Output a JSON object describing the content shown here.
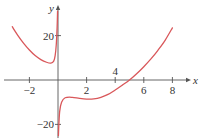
{
  "chart_data": {
    "type": "line",
    "title": "",
    "xlabel": "x",
    "ylabel": "y",
    "xlim": [
      -3.8,
      9.5
    ],
    "ylim": [
      -27,
      35
    ],
    "x_ticks": [
      {
        "value": -2,
        "label": "−2",
        "pos": "below"
      },
      {
        "value": 2,
        "label": "2",
        "pos": "below"
      },
      {
        "value": 4,
        "label": "4",
        "pos": "above"
      },
      {
        "value": 6,
        "label": "6",
        "pos": "below"
      },
      {
        "value": 8,
        "label": "8",
        "pos": "below"
      }
    ],
    "y_ticks": [
      {
        "value": 20,
        "label": "20"
      },
      {
        "value": -20,
        "label": "−20"
      }
    ],
    "grid": false,
    "curve_color": "#d9575a",
    "axis_color": "#555555",
    "series": [
      {
        "name": "left-branch",
        "points": [
          [
            -3.2,
            24
          ],
          [
            -2.8,
            20
          ],
          [
            -2.4,
            16.5
          ],
          [
            -2.0,
            13.5
          ],
          [
            -1.6,
            11
          ],
          [
            -1.2,
            9.2
          ],
          [
            -0.8,
            8
          ],
          [
            -0.5,
            7.6
          ],
          [
            -0.3,
            8.5
          ],
          [
            -0.2,
            11
          ],
          [
            -0.12,
            16
          ],
          [
            -0.06,
            24
          ],
          [
            -0.03,
            31
          ]
        ]
      },
      {
        "name": "right-branch",
        "points": [
          [
            0.03,
            -25
          ],
          [
            0.06,
            -20
          ],
          [
            0.12,
            -14
          ],
          [
            0.25,
            -10
          ],
          [
            0.5,
            -8
          ],
          [
            1.0,
            -7.8
          ],
          [
            1.5,
            -8.3
          ],
          [
            2.0,
            -8.6
          ],
          [
            2.5,
            -8.5
          ],
          [
            3.0,
            -7.8
          ],
          [
            3.5,
            -6.5
          ],
          [
            4.0,
            -4.5
          ],
          [
            4.5,
            -2.3
          ],
          [
            5.0,
            0
          ],
          [
            5.5,
            2.8
          ],
          [
            6.0,
            6
          ],
          [
            6.5,
            9.5
          ],
          [
            7.0,
            13.5
          ],
          [
            7.5,
            18
          ],
          [
            8.0,
            23.5
          ]
        ]
      }
    ]
  }
}
